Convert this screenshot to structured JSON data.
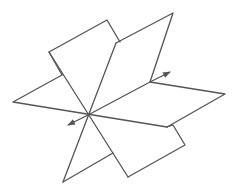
{
  "figure": {
    "stroke_color": "#555555",
    "background": "#ffffff",
    "width": 234,
    "height": 190
  },
  "planes": [
    {
      "name": "vertical-plane-back",
      "points": "49,52 107,20 120,42"
    },
    {
      "name": "slanted-plane",
      "points": "116,43 173,13 150,82"
    },
    {
      "name": "horizontal-plane",
      "points": "13,102 88,115 167,127 225,94 150,82"
    }
  ],
  "intersection_line": {
    "from": [
      68,
      125
    ],
    "to": [
      170,
      72
    ]
  }
}
